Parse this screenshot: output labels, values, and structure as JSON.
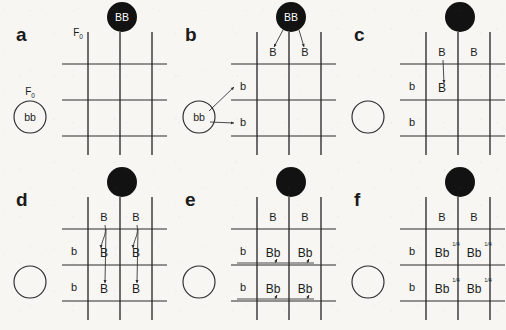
{
  "figure": {
    "background_color": "#f7f6f3",
    "ink_color": "#1b1b1b",
    "dominant_disc_color": "#121212",
    "recessive_disc_color": "#ffffff"
  },
  "generation_label": {
    "text": "F",
    "subscript": "0"
  },
  "parents": {
    "dominant": {
      "genotype": "BB",
      "phenotype_marker": "filled-circle",
      "gametes": [
        "B",
        "B"
      ]
    },
    "recessive": {
      "genotype": "bb",
      "phenotype_marker": "open-circle",
      "gametes": [
        "b",
        "b"
      ]
    }
  },
  "panels": [
    {
      "id": "a",
      "label": "a",
      "caption": "Empty Punnett square with both F0 parents labelled",
      "show_generation_labels": true,
      "show_dominant_genotype": true,
      "show_recessive_genotype": true,
      "column_headers": [],
      "row_headers": [],
      "cells": [],
      "fractions": [],
      "arrows": []
    },
    {
      "id": "b",
      "label": "b",
      "caption": "Gametes drawn out from each parent with arrows",
      "show_generation_labels": false,
      "show_dominant_genotype": true,
      "show_recessive_genotype": true,
      "column_headers": [
        "B",
        "B"
      ],
      "row_headers": [
        "b",
        "b"
      ],
      "cells": [],
      "fractions": [],
      "arrows": [
        "dominant-to-columns",
        "recessive-to-rows"
      ]
    },
    {
      "id": "c",
      "label": "c",
      "caption": "First dominant allele copied into the top-left cell",
      "show_generation_labels": false,
      "show_dominant_genotype": false,
      "show_recessive_genotype": false,
      "column_headers": [
        "B",
        "B"
      ],
      "row_headers": [
        "b",
        "b"
      ],
      "cells": [
        [
          "B",
          ""
        ],
        [
          "",
          ""
        ]
      ],
      "fractions": [],
      "arrows": [
        "col1-to-cell-r1c1"
      ]
    },
    {
      "id": "d",
      "label": "d",
      "caption": "Dominant allele copied down both columns into all four cells",
      "show_generation_labels": false,
      "show_dominant_genotype": false,
      "show_recessive_genotype": false,
      "column_headers": [
        "B",
        "B"
      ],
      "row_headers": [
        "b",
        "b"
      ],
      "cells": [
        [
          "B",
          "B"
        ],
        [
          "B",
          "B"
        ]
      ],
      "fractions": [],
      "arrows": [
        "col1-to-column-cells",
        "col2-to-column-cells"
      ]
    },
    {
      "id": "e",
      "label": "e",
      "caption": "Recessive allele added across each row giving Bb in every cell",
      "show_generation_labels": false,
      "show_dominant_genotype": false,
      "show_recessive_genotype": false,
      "column_headers": [
        "B",
        "B"
      ],
      "row_headers": [
        "b",
        "b"
      ],
      "cells": [
        [
          "Bb",
          "Bb"
        ],
        [
          "Bb",
          "Bb"
        ]
      ],
      "fractions": [],
      "arrows": [
        "row1-to-row-cells",
        "row2-to-row-cells"
      ]
    },
    {
      "id": "f",
      "label": "f",
      "caption": "Completed square: four Bb offspring, each one quarter of the total",
      "show_generation_labels": false,
      "show_dominant_genotype": false,
      "show_recessive_genotype": false,
      "column_headers": [
        "B",
        "B"
      ],
      "row_headers": [
        "b",
        "b"
      ],
      "cells": [
        [
          "Bb",
          "Bb"
        ],
        [
          "Bb",
          "Bb"
        ]
      ],
      "fractions": [
        [
          "1/4",
          "1/4"
        ],
        [
          "1/4",
          "1/4"
        ]
      ],
      "arrows": []
    }
  ],
  "result_summary": {
    "offspring_genotype": "Bb",
    "offspring_count": 4,
    "each_proportion": "1/4",
    "proportion_numerator": 1,
    "proportion_denominator": 4
  }
}
